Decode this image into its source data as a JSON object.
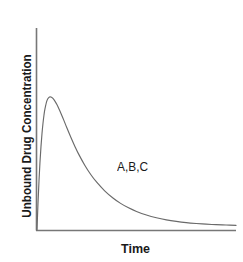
{
  "figure": {
    "background_color": "#ffffff",
    "axis_color": "#777777",
    "curve_color": "#6a6a6a",
    "text_color": "#1a1a1a"
  },
  "axes": {
    "ylabel": "Unbound Drug Concentration",
    "xlabel": "Time"
  },
  "annotations": {
    "curve_label": "A,B,C"
  },
  "chart_data": {
    "type": "line",
    "title": "",
    "xlabel": "Time",
    "ylabel": "Unbound Drug Concentration",
    "xlim": [
      0,
      10
    ],
    "ylim": [
      0,
      10
    ],
    "grid": false,
    "legend": "none",
    "xticks": [],
    "yticks": [],
    "annotations": [
      {
        "text": "A,B,C",
        "x": 4.1,
        "y": 3.05
      }
    ],
    "series": [
      {
        "name": "A,B,C",
        "description": "Unbound drug concentration-time profile; curves A, B and C are superimposed (identical unbound concentrations)",
        "color": "#6a6a6a",
        "x": [
          0.0,
          0.05,
          0.1,
          0.15,
          0.2,
          0.25,
          0.3,
          0.35,
          0.4,
          0.5,
          0.6,
          0.7,
          0.8,
          0.9,
          1.0,
          1.1,
          1.2,
          1.35,
          1.5,
          1.7,
          1.9,
          2.1,
          2.4,
          2.7,
          3.0,
          3.4,
          3.8,
          4.2,
          4.6,
          5.0,
          5.5,
          6.0,
          6.5,
          7.0,
          7.5,
          8.0,
          8.5,
          9.0,
          9.5,
          10.0
        ],
        "y": [
          0.0,
          1.55,
          2.85,
          3.95,
          4.85,
          5.6,
          6.2,
          6.68,
          7.05,
          7.53,
          7.72,
          7.74,
          7.66,
          7.5,
          7.3,
          7.06,
          6.8,
          6.38,
          5.95,
          5.4,
          4.88,
          4.4,
          3.77,
          3.23,
          2.78,
          2.28,
          1.88,
          1.55,
          1.29,
          1.08,
          0.87,
          0.71,
          0.59,
          0.5,
          0.43,
          0.38,
          0.34,
          0.31,
          0.29,
          0.27
        ]
      }
    ]
  }
}
